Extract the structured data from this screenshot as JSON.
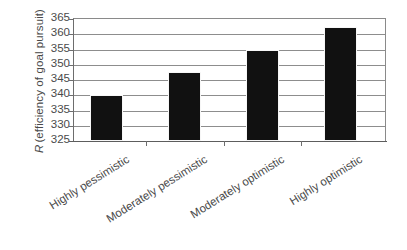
{
  "chart_data": {
    "type": "bar",
    "title": "",
    "subtitle": "",
    "xlabel": "",
    "ylabel": "R (efficiency of goal pursuit)",
    "ylabel_italic_prefix": "R",
    "ylabel_rest": "(efficiency of goal pursuit)",
    "categories": [
      "Highly pessimistic",
      "Moderately pessimistic",
      "Moderately optimistic",
      "Highly optimistic"
    ],
    "values": [
      340.0,
      347.5,
      354.8,
      362.5
    ],
    "ylim": [
      325,
      365
    ],
    "yticks": [
      325,
      330,
      335,
      340,
      345,
      350,
      355,
      360,
      365
    ],
    "ytick_labels": [
      "325",
      "330",
      "335",
      "340",
      "345",
      "350",
      "355",
      "360",
      "365"
    ],
    "grid": true,
    "grid_axis": "y",
    "legend": false,
    "legend_position": "none",
    "bar_color": "#111111",
    "grid_color": "#8d8d8d",
    "axis_color": "#5d5d5d",
    "background_color": "#ffffff",
    "label_rotation_degrees": -32
  }
}
